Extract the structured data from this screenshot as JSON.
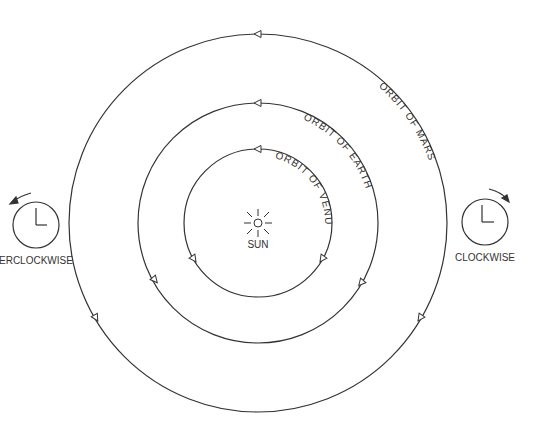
{
  "diagram": {
    "type": "orbital-directions",
    "center": {
      "x": 258,
      "y": 223
    },
    "sun": {
      "label": "SUN"
    },
    "orbits": [
      {
        "name": "venus",
        "label": "ORBIT OF VENUS",
        "radius": 74
      },
      {
        "name": "earth",
        "label": "ORBIT OF EARTH",
        "radius": 120
      },
      {
        "name": "mars",
        "label": "ORBIT OF MARS",
        "radius": 189
      }
    ],
    "direction_legend": {
      "counterclockwise": {
        "label": "COUNTERCLOCKWISE",
        "visible_text": "ERCLOCKWISE"
      },
      "clockwise": {
        "label": "CLOCKWISE"
      }
    },
    "colors": {
      "line": "#333333",
      "background": "#ffffff"
    }
  }
}
